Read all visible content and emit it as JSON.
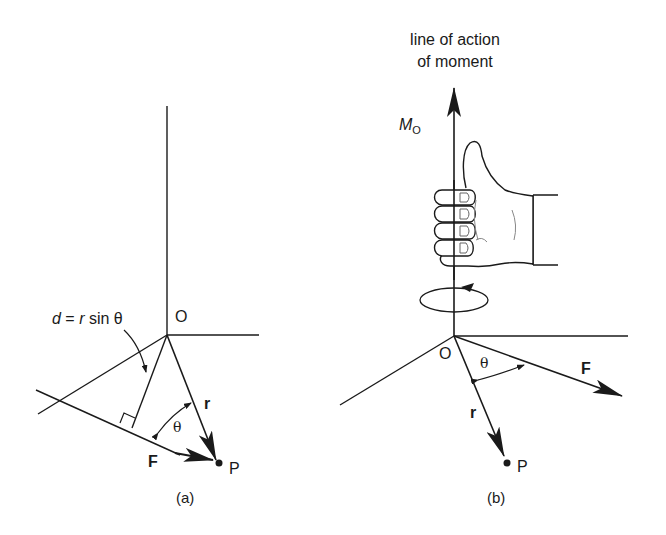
{
  "figure_a": {
    "caption": "(a)",
    "origin_label": "O",
    "point_label": "P",
    "r_label": "r",
    "F_label": "F",
    "theta_label": "θ",
    "d_label_d": "d",
    "d_label_eq": " = ",
    "d_label_r": "r",
    "d_label_rest": " sin θ"
  },
  "figure_b": {
    "caption": "(b)",
    "title_line1": "line of action",
    "title_line2": "of moment",
    "moment_label_M": "M",
    "moment_label_sub": "O",
    "origin_label": "O",
    "point_label": "P",
    "r_label": "r",
    "F_label": "F",
    "theta_label": "θ"
  },
  "colors": {
    "ink": "#1a1a1a",
    "background": "#ffffff"
  }
}
